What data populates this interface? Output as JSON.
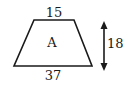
{
  "figure": {
    "shape": "trapezoid",
    "region_label": "A",
    "top_base": "15",
    "bottom_base": "37",
    "height": "18",
    "stroke_color": "#1a1a1a",
    "background": "#ffffff"
  }
}
